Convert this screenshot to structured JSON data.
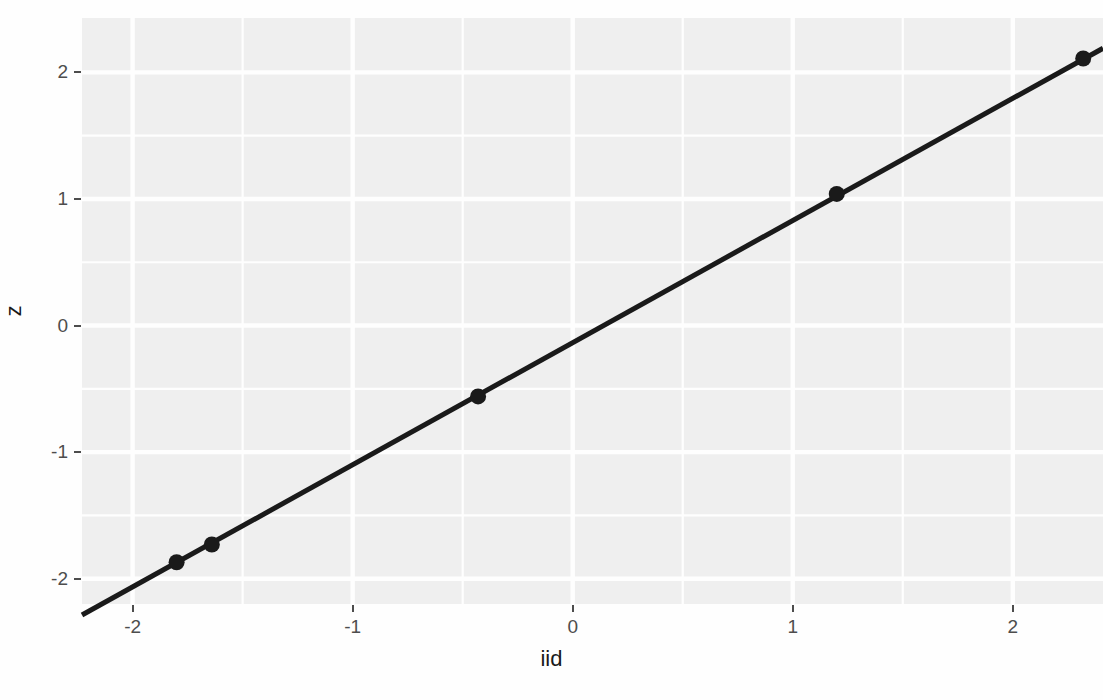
{
  "chart_data": {
    "type": "scatter",
    "title": "",
    "xlabel": "iid",
    "ylabel": "z",
    "xlim": [
      -2.23,
      2.41
    ],
    "ylim": [
      -2.2,
      2.43
    ],
    "xticks": [
      -2,
      -1,
      0,
      1,
      2
    ],
    "xtick_labels": [
      "-2",
      "-1",
      "0",
      "1",
      "2"
    ],
    "yticks": [
      -2,
      -1,
      0,
      1,
      2
    ],
    "ytick_labels": [
      "-2",
      "-1",
      "0",
      "1",
      "2"
    ],
    "grid": true,
    "minor_grid": true,
    "legend": "none",
    "points": [
      {
        "x": -1.8,
        "y": -1.87
      },
      {
        "x": -1.64,
        "y": -1.73
      },
      {
        "x": -0.43,
        "y": -0.56
      },
      {
        "x": 1.2,
        "y": 1.04
      },
      {
        "x": 2.32,
        "y": 2.11
      }
    ],
    "series": [
      {
        "name": "points",
        "x": [
          -1.8,
          -1.64,
          -0.43,
          1.2,
          2.32
        ],
        "y": [
          -1.87,
          -1.73,
          -0.56,
          1.04,
          2.11
        ]
      },
      {
        "name": "fit-line",
        "type": "line",
        "slope": 0.965,
        "intercept": -0.135,
        "x": [
          -2.23,
          2.41
        ],
        "y": [
          -2.29,
          2.19
        ]
      }
    ],
    "point_color": "#1a1a1a",
    "line_color": "#1a1a1a",
    "panel_background": "#f0f0f0",
    "gridline_color": "#ffffff"
  },
  "axes": {
    "x_title": "iid",
    "y_title": "z"
  },
  "header": {
    "clipped_text": ""
  }
}
